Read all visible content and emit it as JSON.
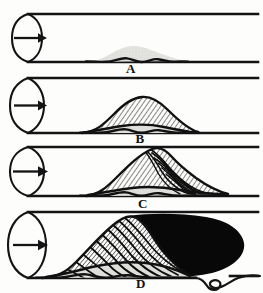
{
  "figure": {
    "background_color": "#fdfdfc",
    "ink_color": "#141414",
    "deposit_fill_color": "#d9d9d6",
    "occlusion_color": "#080808",
    "stage_count": 4
  },
  "panels": [
    {
      "label": "A",
      "label_x": 131,
      "label_y": 73,
      "tube_top_y": 14,
      "tube_bottom_y": 62,
      "cap_cx": 28,
      "cap_rx": 15,
      "cap_ry": 24,
      "arrow_y": 38,
      "arrow_x1": 14,
      "arrow_x2": 44,
      "deposit": {
        "start_x": 88,
        "end_x": 185,
        "peak_x": 133,
        "peak_height": 16,
        "style": "light-stipple",
        "hatching": false,
        "ridges": false,
        "occluded": false
      }
    },
    {
      "label": "B",
      "label_x": 140,
      "label_y": 143,
      "tube_top_y": 78,
      "tube_bottom_y": 133,
      "cap_cx": 28,
      "cap_rx": 15,
      "cap_ry": 27,
      "arrow_y": 106,
      "arrow_x1": 14,
      "arrow_x2": 44,
      "deposit": {
        "start_x": 82,
        "end_x": 198,
        "peak_x": 142,
        "peak_height": 36,
        "style": "hatched-mound",
        "hatching": true,
        "ridges": false,
        "occluded": false
      }
    },
    {
      "label": "C",
      "label_x": 143,
      "label_y": 208,
      "tube_top_y": 147,
      "tube_bottom_y": 196,
      "cap_cx": 28,
      "cap_rx": 15,
      "cap_ry": 25,
      "arrow_y": 172,
      "arrow_x1": 13,
      "arrow_x2": 45,
      "deposit": {
        "start_x": 86,
        "end_x": 228,
        "peak_x": 155,
        "peak_height": 48,
        "style": "hatched-rippled-mound",
        "hatching": true,
        "ridges": true,
        "occluded": false
      }
    },
    {
      "label": "D",
      "label_x": 141,
      "label_y": 288,
      "tube_top_y": 212,
      "tube_bottom_y": 278,
      "cap_cx": 28,
      "cap_rx": 15,
      "cap_ry": 32,
      "arrow_y": 245,
      "arrow_x1": 13,
      "arrow_x2": 46,
      "deposit": {
        "start_x": 42,
        "end_x": 190,
        "peak_x": 120,
        "peak_height": 62,
        "style": "hatched-rippled-mound",
        "hatching": true,
        "ridges": true,
        "occluded": true
      }
    }
  ],
  "occlusion": {
    "name": "thrombus-mass",
    "color": "#080808",
    "left_x": 128,
    "right_x": 244,
    "top_y": 214,
    "bottom_y": 277
  },
  "kink": {
    "name": "tube-wall-kink",
    "x": 196,
    "y": 279,
    "width": 34,
    "height": 14
  },
  "icons": {
    "flow_arrow": "flow-arrow-icon",
    "tube_cap": "tube-end-cap-icon"
  }
}
